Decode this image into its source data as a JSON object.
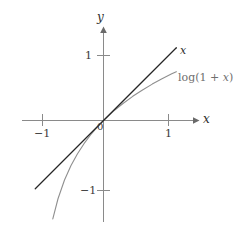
{
  "figure": {
    "background_color": "#ffffff",
    "axis_color": "#8a8a8a",
    "width": 242,
    "height": 231
  },
  "axes": {
    "x_axis_label": "x",
    "y_axis_label": "y",
    "origin_label": "0",
    "x_ticks": [
      {
        "label": "−1",
        "value": -1
      },
      {
        "label": "1",
        "value": 1
      }
    ],
    "y_ticks": [
      {
        "label": "1",
        "value": 1
      },
      {
        "label": "−1",
        "value": -1
      }
    ]
  },
  "curves": {
    "identity": {
      "label": "x",
      "color": "#262626",
      "width": 1.2
    },
    "logarithm": {
      "label_prefix": "log(1 + ",
      "label_var": "x",
      "label_suffix": ")",
      "label_full": "log(1 + x)",
      "color": "#8f8f8f",
      "width": 1.1
    }
  },
  "chart_data": {
    "type": "line",
    "title": "",
    "xlabel": "x",
    "ylabel": "y",
    "xlim": [
      -1.25,
      1.45
    ],
    "ylim": [
      -1.45,
      1.45
    ],
    "xticks": [
      -1,
      1
    ],
    "xticklabels": [
      "−1",
      "1"
    ],
    "yticks": [
      -1,
      1
    ],
    "yticklabels": [
      "−1",
      "1"
    ],
    "grid": false,
    "legend": "inline-annotations",
    "annotations": [
      {
        "text": "x",
        "x": 1.18,
        "y": 1.07
      },
      {
        "text": "log(1 + x)",
        "x": 1.18,
        "y": 0.65
      },
      {
        "text": "0",
        "x": -0.03,
        "y": -0.1
      }
    ],
    "series": [
      {
        "name": "x",
        "color": "#262626",
        "x": [
          -1.05,
          -0.9,
          -0.75,
          -0.6,
          -0.45,
          -0.3,
          -0.15,
          0,
          0.15,
          0.3,
          0.45,
          0.6,
          0.75,
          0.9,
          1.05,
          1.12
        ],
        "y": [
          -1.05,
          -0.9,
          -0.75,
          -0.6,
          -0.45,
          -0.3,
          -0.15,
          0,
          0.15,
          0.3,
          0.45,
          0.6,
          0.75,
          0.9,
          1.05,
          1.12
        ]
      },
      {
        "name": "log(1 + x)",
        "color": "#8f8f8f",
        "x": [
          -0.78,
          -0.7,
          -0.6,
          -0.5,
          -0.4,
          -0.3,
          -0.2,
          -0.1,
          0,
          0.15,
          0.3,
          0.45,
          0.6,
          0.75,
          0.9,
          1.05,
          1.12
        ],
        "y": [
          -1.514,
          -1.204,
          -0.916,
          -0.693,
          -0.511,
          -0.357,
          -0.223,
          -0.105,
          0,
          0.14,
          0.262,
          0.372,
          0.47,
          0.56,
          0.642,
          0.718,
          0.751
        ]
      }
    ]
  }
}
